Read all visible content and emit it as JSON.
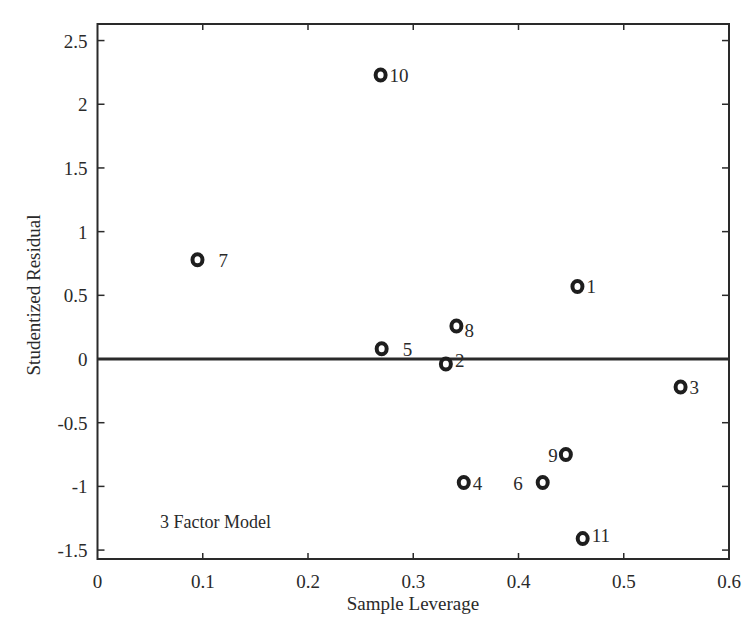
{
  "chart_data": {
    "type": "scatter",
    "title": "",
    "xlabel": "Sample Leverage",
    "ylabel": "Studentized Residual",
    "xlim": [
      0,
      0.6
    ],
    "ylim": [
      -1.57,
      2.63
    ],
    "xticks": [
      0,
      0.1,
      0.2,
      0.3,
      0.4,
      0.5,
      0.6
    ],
    "xtick_labels": [
      "0",
      "0.1",
      "0.2",
      "0.3",
      "0.4",
      "0.5",
      "0.6"
    ],
    "yticks": [
      -1.5,
      -1,
      -0.5,
      0,
      0.5,
      1,
      1.5,
      2,
      2.5
    ],
    "ytick_labels": [
      "-1.5",
      "-1",
      "-0.5",
      "0",
      "0.5",
      "1",
      "1.5",
      "2",
      "2.5"
    ],
    "grid": false,
    "reference_line": {
      "y": 0
    },
    "annotation": "3 Factor Model",
    "marker": "ring",
    "points": [
      {
        "label": "1",
        "x": 0.456,
        "y": 0.57,
        "label_pos": "right"
      },
      {
        "label": "2",
        "x": 0.331,
        "y": -0.04,
        "label_pos": "right-up"
      },
      {
        "label": "3",
        "x": 0.554,
        "y": -0.22,
        "label_pos": "right"
      },
      {
        "label": "4",
        "x": 0.348,
        "y": -0.97,
        "label_pos": "right"
      },
      {
        "label": "5",
        "x": 0.27,
        "y": 0.08,
        "label_pos": "right-far"
      },
      {
        "label": "6",
        "x": 0.423,
        "y": -0.97,
        "label_pos": "left-far"
      },
      {
        "label": "7",
        "x": 0.095,
        "y": 0.78,
        "label_pos": "right-far"
      },
      {
        "label": "8",
        "x": 0.341,
        "y": 0.26,
        "label_pos": "right-down"
      },
      {
        "label": "9",
        "x": 0.445,
        "y": -0.75,
        "label_pos": "left"
      },
      {
        "label": "10",
        "x": 0.269,
        "y": 2.23,
        "label_pos": "right"
      },
      {
        "label": "11",
        "x": 0.461,
        "y": -1.41,
        "label_pos": "right-up"
      }
    ]
  }
}
